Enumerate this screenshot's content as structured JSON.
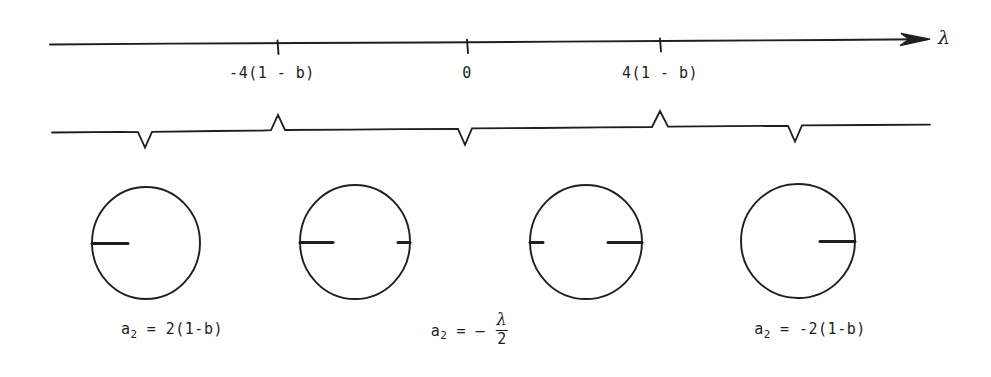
{
  "figure": {
    "ink_color": "#1f1f1f",
    "background_color": "#fefefe"
  },
  "axis": {
    "name": "λ",
    "arrow_direction": "right",
    "ticks": [
      {
        "x": 272,
        "label": "-4(1 - b)"
      },
      {
        "x": 467,
        "label": "0"
      },
      {
        "x": 660,
        "label": "4(1 - b)"
      }
    ]
  },
  "brace": {
    "regions": [
      {
        "center_x": 145,
        "from": "-infinity",
        "to": "-4(1 - b)"
      },
      {
        "center_x": 355,
        "from": "-4(1 - b)",
        "to": "0"
      },
      {
        "center_x": 566,
        "from": "0",
        "to": "4(1 - b)"
      },
      {
        "center_x": 797,
        "from": "4(1 - b)",
        "to": "+infinity"
      }
    ],
    "dividers_x": [
      278,
      467,
      660
    ]
  },
  "circles": [
    {
      "id": "circle-1",
      "center_x": 146,
      "center_y": 243,
      "radius": 54,
      "cuts": [
        {
          "side": "left",
          "fraction": 0.33
        }
      ],
      "caption": {
        "var": "a",
        "subscript": "2",
        "equals": "=",
        "value": "2(1-b)",
        "full": "a2 = 2(1-b)",
        "x": 172,
        "y": 320
      }
    },
    {
      "id": "circle-2",
      "center_x": 355,
      "center_y": 242,
      "radius": 55,
      "cuts": [
        {
          "side": "left",
          "fraction": 0.3
        },
        {
          "side": "right",
          "fraction": 0.11
        }
      ],
      "caption": null
    },
    {
      "id": "circle-3",
      "center_x": 586,
      "center_y": 242,
      "radius": 56,
      "cuts": [
        {
          "side": "left",
          "fraction": 0.11
        },
        {
          "side": "right",
          "fraction": 0.3
        }
      ],
      "caption": {
        "var": "a",
        "subscript": "2",
        "equals": "=",
        "value": "- λ/2",
        "numerator": "λ",
        "denominator": "2",
        "full": "a2 = - λ/2",
        "x": 470,
        "y": 316
      }
    },
    {
      "id": "circle-4",
      "center_x": 798,
      "center_y": 241,
      "radius": 57,
      "cuts": [
        {
          "side": "right",
          "fraction": 0.33
        }
      ],
      "caption": {
        "var": "a",
        "subscript": "2",
        "equals": "=",
        "value": "-2(1-b)",
        "full": "a2 = -2(1-b)",
        "x": 810,
        "y": 320
      }
    }
  ]
}
